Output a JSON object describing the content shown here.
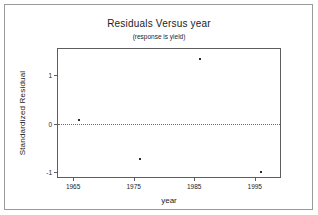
{
  "chart_data": {
    "type": "scatter",
    "title": "Residuals Versus year",
    "subtitle": "(response is yield)",
    "xlabel": "year",
    "ylabel": "Standardized Residual",
    "xlim": [
      1962.5,
      1999.5
    ],
    "ylim": [
      -1.15,
      1.55
    ],
    "xticks": [
      1965,
      1975,
      1985,
      1995
    ],
    "xtick_labels": [
      "1965",
      "1975",
      "1985",
      "1995"
    ],
    "yticks": [
      1,
      0,
      -1
    ],
    "ytick_labels": [
      "1",
      "0",
      "-1"
    ],
    "grid": false,
    "legend": null,
    "reference_line": {
      "name": "zero-reference-line",
      "y": 0,
      "style": "dotted",
      "color": "#6b6b6b"
    },
    "points": [
      {
        "x": 1966,
        "y": 0.08
      },
      {
        "x": 1976,
        "y": -0.73
      },
      {
        "x": 1986,
        "y": 1.35
      },
      {
        "x": 1996,
        "y": -1.0
      }
    ],
    "marker": {
      "shape": "dot",
      "color": "#2b2b2b",
      "size": 2
    },
    "colors": {
      "axis": "#5d5d5d",
      "text": "#1c1c1c",
      "background": "#ffffff",
      "outer_border": "#9a9a9a"
    }
  }
}
